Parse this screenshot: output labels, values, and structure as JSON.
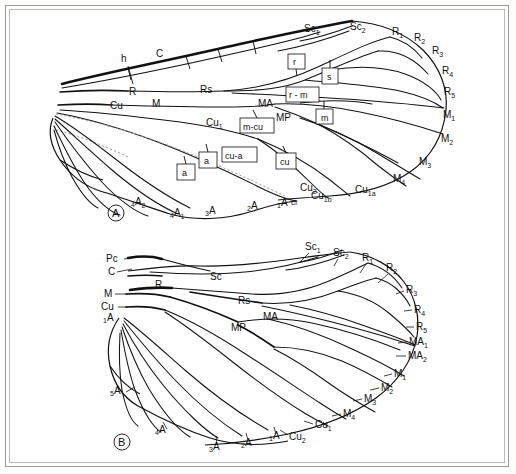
{
  "figure": {
    "panels": [
      {
        "id": "A",
        "letter": "A",
        "caption": "A",
        "description": "Generalized dipteran-type wing with named longitudinal veins, crossveins and cells",
        "vein_labels": [
          {
            "text": "h",
            "x": 124,
            "y": 61
          },
          {
            "text": "C",
            "x": 159,
            "y": 57
          },
          {
            "text": "R",
            "x": 133,
            "y": 92
          },
          {
            "text": "Rs",
            "x": 204,
            "y": 90
          },
          {
            "text": "Cu",
            "x": 118,
            "y": 106
          },
          {
            "text": "M",
            "x": 155,
            "y": 104
          },
          {
            "text": "MA",
            "x": 264,
            "y": 105
          },
          {
            "text": "MP",
            "x": 281,
            "y": 118
          },
          {
            "text": "Sc",
            "sub": "1",
            "x": 310,
            "y": 29
          },
          {
            "text": "Sc",
            "sub": "2",
            "x": 356,
            "y": 27
          },
          {
            "text": "R",
            "sub": "1",
            "x": 397,
            "y": 32
          },
          {
            "text": "R",
            "sub": "2",
            "x": 419,
            "y": 38
          },
          {
            "text": "R",
            "sub": "3",
            "x": 437,
            "y": 51
          },
          {
            "text": "R",
            "sub": "4",
            "x": 447,
            "y": 71
          },
          {
            "text": "R",
            "sub": "5",
            "x": 449,
            "y": 92
          },
          {
            "text": "M",
            "sub": "1",
            "x": 448,
            "y": 115
          },
          {
            "text": "M",
            "sub": "2",
            "x": 446,
            "y": 139
          },
          {
            "text": "M",
            "sub": "3",
            "x": 424,
            "y": 162
          },
          {
            "text": "M",
            "sub": "4",
            "x": 398,
            "y": 179
          },
          {
            "text": "Cu",
            "sub": "1a",
            "x": 362,
            "y": 190
          },
          {
            "text": "Cu",
            "sub": "1b",
            "x": 318,
            "y": 196
          },
          {
            "text": "Cu",
            "sub": "2",
            "x": 307,
            "y": 199
          },
          {
            "text": "cf",
            "x": 295,
            "y": 207
          },
          {
            "text": "Cu",
            "sub": "1",
            "x": 213,
            "y": 123
          }
        ],
        "anal_labels": [
          {
            "pre": "4",
            "text": "A",
            "sub": "2",
            "x": 140,
            "y": 205
          },
          {
            "pre": "4",
            "text": "A",
            "sub": "1",
            "x": 179,
            "y": 216
          },
          {
            "pre": "3",
            "text": "A",
            "x": 211,
            "y": 214
          },
          {
            "pre": "2",
            "text": "A",
            "x": 253,
            "y": 209
          },
          {
            "pre": "1",
            "text": "A",
            "x": 283,
            "y": 207
          }
        ],
        "cell_labels": [
          {
            "text": "r",
            "x": 296,
            "y": 62
          },
          {
            "text": "s",
            "x": 330,
            "y": 76
          },
          {
            "text": "r - m",
            "x": 297,
            "y": 95
          },
          {
            "text": "m",
            "x": 324,
            "y": 117
          },
          {
            "text": "m-cu",
            "x": 255,
            "y": 126
          },
          {
            "text": "cu-a",
            "x": 238,
            "y": 155
          },
          {
            "text": "cu",
            "x": 285,
            "y": 161
          },
          {
            "text": "a",
            "x": 208,
            "y": 160
          },
          {
            "text": "a",
            "x": 186,
            "y": 172
          }
        ]
      },
      {
        "id": "B",
        "letter": "B",
        "caption": "B",
        "description": "Archaic generalized wing with precosta and separate MA1, MA2",
        "vein_labels": [
          {
            "text": "Pc",
            "x": 113,
            "y": 258
          },
          {
            "text": "C",
            "x": 113,
            "y": 271
          },
          {
            "text": "M",
            "x": 110,
            "y": 294
          },
          {
            "text": "Cu",
            "x": 110,
            "y": 307
          },
          {
            "text": "R",
            "x": 158,
            "y": 285
          },
          {
            "text": "Sc",
            "x": 215,
            "y": 277
          },
          {
            "text": "Rs",
            "x": 244,
            "y": 300
          },
          {
            "text": "MA",
            "x": 270,
            "y": 317
          },
          {
            "text": "MP",
            "x": 238,
            "y": 327
          },
          {
            "text": "Sc",
            "sub": "1",
            "x": 311,
            "y": 248
          },
          {
            "text": "Sc",
            "sub": "2",
            "x": 339,
            "y": 253
          },
          {
            "text": "R",
            "sub": "1",
            "x": 367,
            "y": 258
          },
          {
            "text": "R",
            "sub": "2",
            "x": 392,
            "y": 268
          },
          {
            "text": "R",
            "sub": "3",
            "x": 412,
            "y": 290
          },
          {
            "text": "R",
            "sub": "4",
            "x": 420,
            "y": 310
          },
          {
            "text": "R",
            "sub": "5",
            "x": 422,
            "y": 327
          },
          {
            "text": "MA",
            "sub": "1",
            "x": 418,
            "y": 342
          },
          {
            "text": "MA",
            "sub": "2",
            "x": 417,
            "y": 356
          },
          {
            "text": "M",
            "sub": "1",
            "x": 400,
            "y": 374
          },
          {
            "text": "M",
            "sub": "2",
            "x": 387,
            "y": 388
          },
          {
            "text": "M",
            "sub": "3",
            "x": 370,
            "y": 399
          },
          {
            "text": "M",
            "sub": "4",
            "x": 349,
            "y": 414
          },
          {
            "text": "Cu",
            "sub": "1",
            "x": 321,
            "y": 425
          },
          {
            "text": "Cu",
            "sub": "2",
            "x": 295,
            "y": 437
          }
        ],
        "anal_labels": [
          {
            "pre": "1",
            "text": "A",
            "x": 110,
            "y": 320
          },
          {
            "pre": "5",
            "text": "A",
            "x": 117,
            "y": 393
          },
          {
            "pre": "4",
            "text": "A",
            "x": 162,
            "y": 432
          },
          {
            "pre": "3",
            "text": "A",
            "x": 215,
            "y": 449
          },
          {
            "pre": "2",
            "text": "A",
            "x": 247,
            "y": 445
          },
          {
            "pre": "1",
            "text": "A",
            "x": 275,
            "y": 438
          }
        ]
      }
    ]
  },
  "colors": {
    "ink": "#111111",
    "frame": "#9a9a9a",
    "furrow": "#9a9a9a",
    "background": "#ffffff"
  }
}
